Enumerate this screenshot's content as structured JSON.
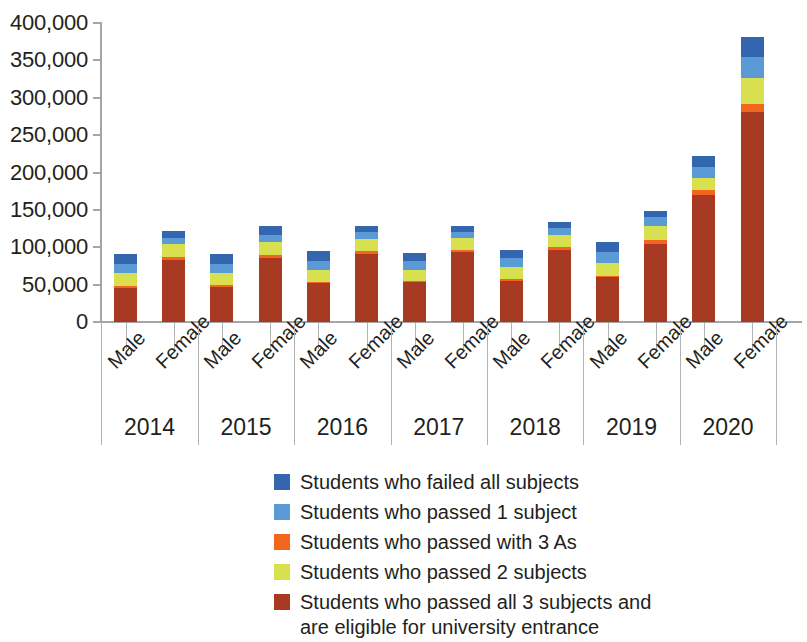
{
  "chart_data": {
    "type": "bar",
    "subtype": "stacked",
    "title": "",
    "xlabel": "",
    "ylabel": "",
    "ylim": [
      0,
      400000
    ],
    "ytick_interval": 50000,
    "ytick_labels": [
      "400,000",
      "350,000",
      "300,000",
      "250,000",
      "200,000",
      "150,000",
      "100,000",
      "50,000",
      "0"
    ],
    "ytick_values": [
      400000,
      350000,
      300000,
      250000,
      200000,
      150000,
      100000,
      50000,
      0
    ],
    "grid": false,
    "legend_position": "bottom",
    "years": [
      "2014",
      "2015",
      "2016",
      "2017",
      "2018",
      "2019",
      "2020"
    ],
    "genders": [
      "Male",
      "Female"
    ],
    "categories": [
      "2014 Male",
      "2014 Female",
      "2015 Male",
      "2015 Female",
      "2016 Male",
      "2016 Female",
      "2017 Male",
      "2017 Female",
      "2018 Male",
      "2018 Female",
      "2019 Male",
      "2019 Female",
      "2020 Male",
      "2020 Female"
    ],
    "series": [
      {
        "name": "Students who passed all 3 subjects and are eligible for university entrance",
        "color": "#a83a24",
        "stack_order": 1,
        "values": [
          46000,
          83000,
          47000,
          86000,
          52000,
          91000,
          53000,
          93000,
          55000,
          97000,
          60000,
          105000,
          170000,
          281000
        ]
      },
      {
        "name": "Students who passed with 3 As",
        "color": "#f2651c",
        "stack_order": 2,
        "values": [
          2000,
          4000,
          2000,
          4000,
          2000,
          4000,
          2000,
          4000,
          2000,
          4000,
          2000,
          5000,
          7000,
          10000
        ]
      },
      {
        "name": "Students who passed 2 subjects",
        "color": "#d9e04f",
        "stack_order": 3,
        "values": [
          17000,
          17000,
          16000,
          17000,
          16000,
          16000,
          15000,
          15000,
          16000,
          16000,
          17000,
          19000,
          16000,
          36000
        ]
      },
      {
        "name": "Students who passed 1 subject",
        "color": "#5b9bd5",
        "stack_order": 4,
        "values": [
          12000,
          9000,
          12000,
          10000,
          12000,
          9000,
          11000,
          9000,
          12000,
          9000,
          15000,
          11000,
          15000,
          28000
        ]
      },
      {
        "name": "Students who failed all subjects",
        "color": "#3466b0",
        "stack_order": 5,
        "values": [
          14000,
          9000,
          14000,
          11000,
          13000,
          9000,
          11000,
          8000,
          12000,
          8000,
          13000,
          9000,
          14000,
          26000
        ]
      }
    ],
    "totals": [
      91000,
      122000,
      91000,
      128000,
      95000,
      129000,
      92000,
      129000,
      97000,
      134000,
      107000,
      149000,
      222000,
      381000
    ]
  },
  "legend": {
    "items": [
      {
        "label": "Students who failed all subjects",
        "color": "#3466b0"
      },
      {
        "label": "Students who passed 1 subject",
        "color": "#5b9bd5"
      },
      {
        "label": "Students who passed with 3 As",
        "color": "#f2651c"
      },
      {
        "label": "Students who passed 2 subjects",
        "color": "#d9e04f"
      },
      {
        "label": "Students who passed all 3 subjects and\nare eligible for university entrance",
        "color": "#a83a24"
      }
    ]
  },
  "axis": {
    "y_labels": [
      "400,000",
      "350,000",
      "300,000",
      "250,000",
      "200,000",
      "150,000",
      "100,000",
      "50,000",
      "0"
    ],
    "gender_labels": [
      "Male",
      "Female",
      "Male",
      "Female",
      "Male",
      "Female",
      "Male",
      "Female",
      "Male",
      "Female",
      "Male",
      "Female",
      "Male",
      "Female"
    ],
    "year_labels": [
      "2014",
      "2015",
      "2016",
      "2017",
      "2018",
      "2019",
      "2020"
    ]
  }
}
